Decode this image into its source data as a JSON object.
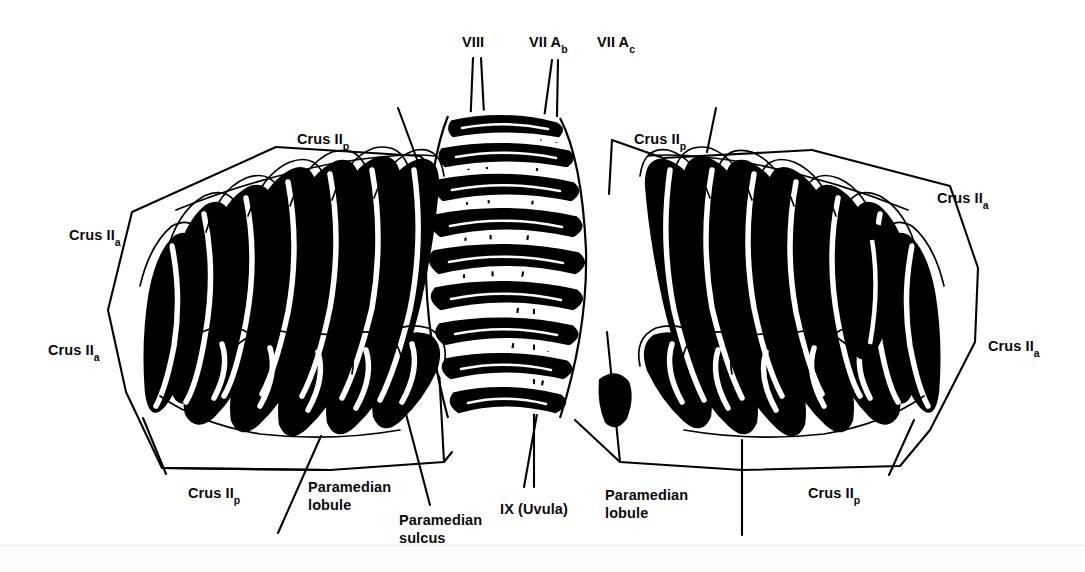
{
  "figure": {
    "background_color": "#ffffff",
    "ink_color": "#000000",
    "width": 1085,
    "height": 572
  },
  "labels": {
    "viii": {
      "text": "VIII",
      "x": 462,
      "y": 33
    },
    "vii_ab_main": {
      "text": "VII A",
      "sub": "b",
      "x": 529,
      "y": 33
    },
    "vii_ac_main": {
      "text": "VII A",
      "sub": "c",
      "x": 597,
      "y": 33
    },
    "crus2p_top_left": {
      "text": "Crus II",
      "sub": "p",
      "x": 297,
      "y": 130
    },
    "crus2p_top_right": {
      "text": "Crus II",
      "sub": "p",
      "x": 634,
      "y": 130
    },
    "crus2a_left_upper": {
      "text": "Crus II",
      "sub": "a",
      "x": 69,
      "y": 226
    },
    "crus2a_left_lower": {
      "text": "Crus II",
      "sub": "a",
      "x": 48,
      "y": 341
    },
    "crus2a_right_upper": {
      "text": "Crus II",
      "sub": "a",
      "x": 937,
      "y": 189
    },
    "crus2a_right_lower": {
      "text": "Crus II",
      "sub": "a",
      "x": 988,
      "y": 337
    },
    "crus2p_bottom_left": {
      "text": "Crus II",
      "sub": "p",
      "x": 188,
      "y": 484
    },
    "crus2p_bottom_right": {
      "text": "Crus II",
      "sub": "p",
      "x": 808,
      "y": 484
    },
    "paramedian_lobule_left": {
      "text": "Paramedian\nlobule",
      "x": 308,
      "y": 479
    },
    "paramedian_lobule_right": {
      "text": "Paramedian\nlobule",
      "x": 605,
      "y": 487
    },
    "paramedian_sulcus": {
      "text": "Paramedian\nsulcus",
      "x": 399,
      "y": 512
    },
    "ix_uvula": {
      "text": "IX (Uvula)",
      "x": 500,
      "y": 500
    }
  },
  "anatomy": {
    "regions": [
      "Left cerebellar hemisphere",
      "Right cerebellar hemisphere",
      "Vermis (midline)",
      "Lobule VIII",
      "Lobule VII A b",
      "Lobule VII A c",
      "Lobule IX (Uvula)",
      "Crus II anterior",
      "Crus II posterior",
      "Paramedian lobule",
      "Paramedian sulcus"
    ]
  }
}
